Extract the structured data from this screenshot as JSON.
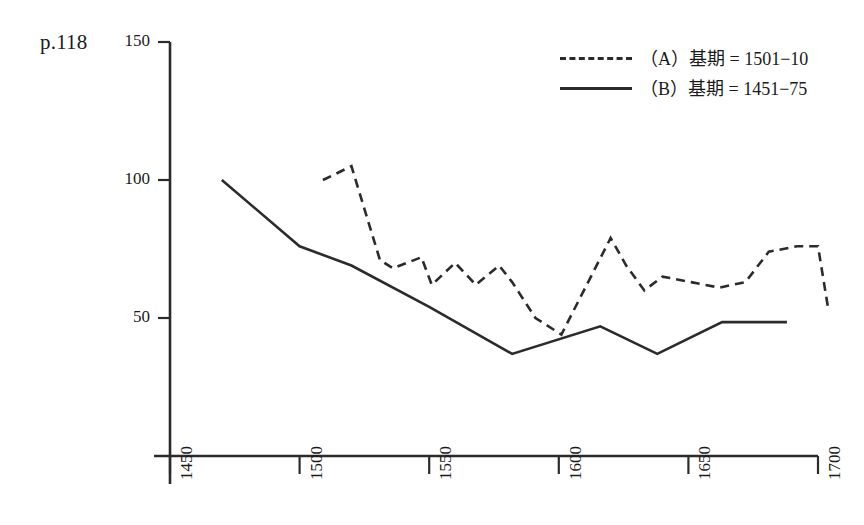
{
  "page_label": "p.118",
  "legend": {
    "position": "top-right",
    "entries": [
      {
        "style": "dashed",
        "label": "（A）基期 = 1501−10"
      },
      {
        "style": "solid",
        "label": "（B）基期 = 1451−75"
      }
    ]
  },
  "chart_data": {
    "type": "line",
    "title": "",
    "xlabel": "",
    "ylabel": "",
    "xlim": [
      1450,
      1700
    ],
    "ylim": [
      0,
      150
    ],
    "xticks": [
      1450,
      1500,
      1550,
      1600,
      1650,
      1700
    ],
    "yticks": [
      50,
      100,
      150
    ],
    "grid": false,
    "axis_color": "#2b2b2b",
    "series": [
      {
        "name": "（A）基期 = 1501−10",
        "style": "dashed",
        "color": "#2b2b2b",
        "x": [
          1509,
          1520,
          1531,
          1536,
          1547,
          1551,
          1560,
          1568,
          1577,
          1582,
          1591,
          1601,
          1620,
          1626,
          1633,
          1640,
          1651,
          1662,
          1672,
          1681,
          1692,
          1700,
          1704
        ],
        "y": [
          100,
          105,
          71,
          68,
          72,
          62,
          70,
          62,
          69,
          63,
          50,
          44,
          79,
          69,
          60,
          65,
          63,
          61,
          63,
          74,
          76,
          76,
          53
        ]
      },
      {
        "name": "（B）基期 = 1451−75",
        "style": "solid",
        "color": "#2b2b2b",
        "x": [
          1470,
          1500,
          1520,
          1550,
          1582,
          1616,
          1638,
          1663,
          1688
        ],
        "y": [
          100,
          76,
          69,
          54,
          37,
          47,
          37,
          48.5,
          48.5
        ]
      }
    ]
  }
}
